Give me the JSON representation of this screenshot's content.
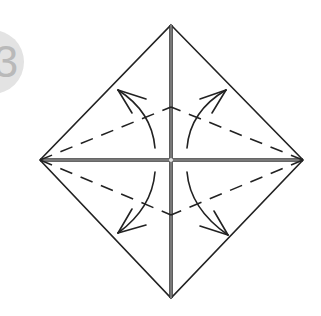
{
  "step": {
    "number": "3",
    "badge_color": "#e3e3e3",
    "text_color": "#b9b9b9"
  },
  "diagram": {
    "type": "origami-fold-diagram",
    "shape": "square-rotated-45",
    "vertices": {
      "top": [
        171,
        25
      ],
      "right": [
        303,
        160
      ],
      "bottom": [
        171,
        298
      ],
      "left": [
        40,
        160
      ]
    },
    "creases": [
      "vertical-center",
      "horizontal-center"
    ],
    "valley_folds": "dashed-kite-lines",
    "arrows": [
      "upper-left",
      "upper-right",
      "lower-left",
      "lower-right"
    ],
    "line_color": "#222222",
    "crease_color": "#444444"
  }
}
